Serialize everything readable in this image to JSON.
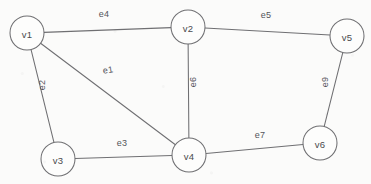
{
  "diagram": {
    "canvas": {
      "width": 371,
      "height": 184
    },
    "colors": {
      "background": "#fbfbfa",
      "stroke": "#6f6f72",
      "node_fill": "#fdfdfc",
      "text": "#4a4a4d"
    },
    "nodes": [
      {
        "id": "v1",
        "label": "v1",
        "x": 27,
        "y": 33,
        "r": 17
      },
      {
        "id": "v2",
        "label": "v2",
        "x": 188,
        "y": 27,
        "r": 17
      },
      {
        "id": "v3",
        "label": "v3",
        "x": 58,
        "y": 159,
        "r": 17
      },
      {
        "id": "v4",
        "label": "v4",
        "x": 189,
        "y": 155,
        "r": 17
      },
      {
        "id": "v5",
        "label": "v5",
        "x": 347,
        "y": 36,
        "r": 17
      },
      {
        "id": "v6",
        "label": "v6",
        "x": 320,
        "y": 143,
        "r": 17
      }
    ],
    "edges": [
      {
        "id": "e1",
        "label": "e1",
        "source": "v1",
        "target": "v4",
        "label_x": 108,
        "label_y": 70,
        "label_rotation": -9
      },
      {
        "id": "e2",
        "label": "e2",
        "source": "v1",
        "target": "v3",
        "label_x": 42,
        "label_y": 85,
        "label_rotation": -90
      },
      {
        "id": "e3",
        "label": "e3",
        "source": "v3",
        "target": "v4",
        "label_x": 122,
        "label_y": 143,
        "label_rotation": 0
      },
      {
        "id": "e4",
        "label": "e4",
        "source": "v1",
        "target": "v2",
        "label_x": 104,
        "label_y": 14,
        "label_rotation": 0
      },
      {
        "id": "e5",
        "label": "e5",
        "source": "v2",
        "target": "v5",
        "label_x": 266,
        "label_y": 15,
        "label_rotation": 0
      },
      {
        "id": "e6",
        "label": "e6",
        "source": "v2",
        "target": "v4",
        "label_x": 193,
        "label_y": 82,
        "label_rotation": -90
      },
      {
        "id": "e7",
        "label": "e7",
        "source": "v4",
        "target": "v6",
        "label_x": 260,
        "label_y": 135,
        "label_rotation": 0
      },
      {
        "id": "e9",
        "label": "e9",
        "source": "v5",
        "target": "v6",
        "label_x": 325,
        "label_y": 82,
        "label_rotation": -90
      }
    ]
  }
}
